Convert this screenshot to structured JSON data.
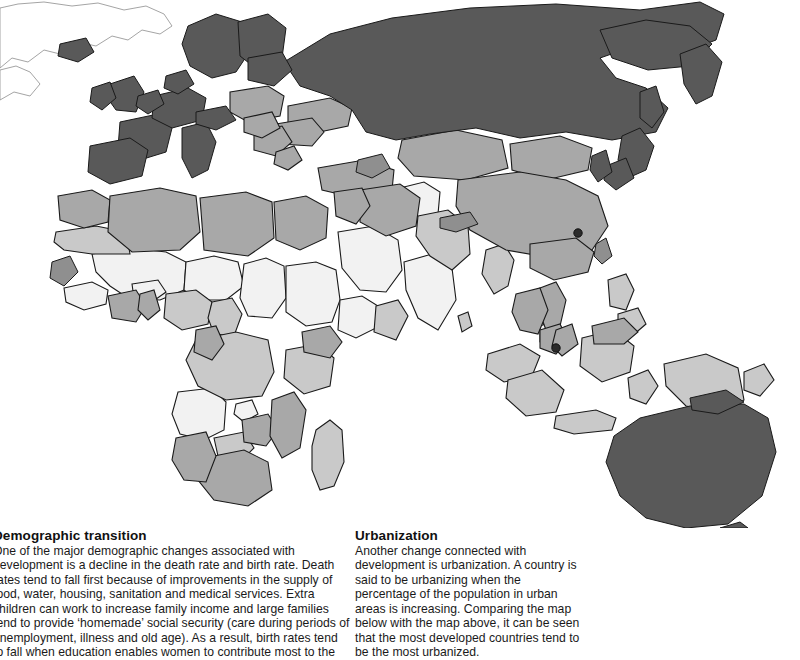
{
  "figure": {
    "type": "choropleth-world-map",
    "hemisphere_shown": "Eastern (Europe, Africa, Asia, Australasia)",
    "palette": {
      "highest": "#595959",
      "high": "#8f8f8f",
      "medium": "#a8a8a8",
      "low": "#c9c9c9",
      "lowest": "#f2f2f2",
      "outline": "#1a1a1a",
      "background": "#ffffff",
      "marker": "#2b2b2b"
    },
    "markers": [
      {
        "name": "hong-kong-marker",
        "x": 578,
        "y": 233
      },
      {
        "name": "singapore-marker",
        "x": 556,
        "y": 348
      }
    ]
  },
  "blocks": [
    {
      "id": "demographic-transition",
      "title": "Demographic transition",
      "body": "One of the major demographic changes associated with\ndevelopment is a decline in the death rate and birth rate. Death\nrates tend to fall first because of improvements in the supply of\nfood, water, housing, sanitation and medical services. Extra\nchildren can work to increase family income and large families\ntend to provide ‘homemade’ social security (care during periods of\nunemployment, illness and old age). As a result, birth rates tend\nto fall when education enables women to contribute most to the"
    },
    {
      "id": "urbanization",
      "title": "Urbanization",
      "body": "Another change connected with\ndevelopment is urbanization. A country is\nsaid to be urbanizing when the\npercentage of the population in urban\nareas is increasing. Comparing the map\nbelow with the map above, it can be seen\nthat the most developed countries tend to\nbe the most urbanized."
    }
  ]
}
